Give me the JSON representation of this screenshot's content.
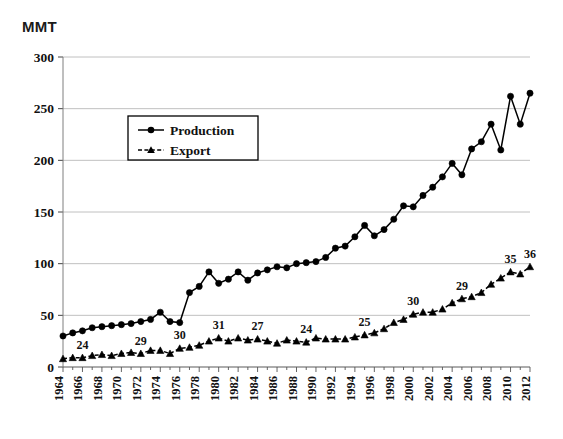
{
  "chart_data": {
    "type": "line",
    "title": "",
    "xlabel": "",
    "ylabel": "MMT",
    "ylim": [
      0,
      300
    ],
    "ytick_step": 50,
    "yticks": [
      0,
      50,
      100,
      150,
      200,
      250,
      300
    ],
    "grid": true,
    "legend_position": "upper-left-inside",
    "x": [
      1964,
      1965,
      1966,
      1967,
      1968,
      1969,
      1970,
      1971,
      1972,
      1973,
      1974,
      1975,
      1976,
      1977,
      1978,
      1979,
      1980,
      1981,
      1982,
      1983,
      1984,
      1985,
      1986,
      1987,
      1988,
      1989,
      1990,
      1991,
      1992,
      1993,
      1994,
      1995,
      1996,
      1997,
      1998,
      1999,
      2000,
      2001,
      2002,
      2003,
      2004,
      2005,
      2006,
      2007,
      2008,
      2009,
      2010,
      2011,
      2012
    ],
    "xtick_labels": [
      "1964",
      "1966",
      "1968",
      "1970",
      "1972",
      "1974",
      "1976",
      "1978",
      "1980",
      "1982",
      "1984",
      "1986",
      "1988",
      "1990",
      "1992",
      "1994",
      "1996",
      "1998",
      "2000",
      "2002",
      "2004",
      "2006",
      "2008",
      "2010",
      "2012"
    ],
    "xtick_values": [
      1964,
      1966,
      1968,
      1970,
      1972,
      1974,
      1976,
      1978,
      1980,
      1982,
      1984,
      1986,
      1988,
      1990,
      1992,
      1994,
      1996,
      1998,
      2000,
      2002,
      2004,
      2006,
      2008,
      2010,
      2012
    ],
    "series": [
      {
        "name": "Production",
        "marker": "circle",
        "line_style": "solid",
        "color": "#000000",
        "values": [
          30,
          33,
          35,
          38,
          39,
          40,
          41,
          42,
          44,
          46,
          53,
          44,
          43,
          72,
          78,
          92,
          81,
          85,
          92,
          84,
          91,
          94,
          97,
          96,
          100,
          101,
          102,
          106,
          115,
          117,
          126,
          137,
          127,
          133,
          143,
          156,
          155,
          166,
          174,
          184,
          197,
          186,
          211,
          218,
          235,
          210,
          262,
          235,
          265
        ]
      },
      {
        "name": "Export",
        "marker": "triangle",
        "line_style": "dashed",
        "color": "#000000",
        "values": [
          8,
          9,
          9,
          11,
          12,
          11,
          13,
          14,
          13,
          16,
          16,
          13,
          18,
          19,
          21,
          25,
          28,
          25,
          28,
          26,
          27,
          25,
          23,
          26,
          25,
          24,
          28,
          27,
          27,
          27,
          29,
          31,
          33,
          37,
          43,
          46,
          51,
          53,
          53,
          56,
          62,
          66,
          68,
          72,
          80,
          86,
          92,
          90,
          97
        ]
      }
    ],
    "annotations": [
      {
        "label": "24",
        "x": 1966,
        "series": "Export",
        "value": 9
      },
      {
        "label": "29",
        "x": 1972,
        "series": "Export",
        "value": 13
      },
      {
        "label": "30",
        "x": 1976,
        "series": "Export",
        "value": 18
      },
      {
        "label": "31",
        "x": 1980,
        "series": "Export",
        "value": 28
      },
      {
        "label": "27",
        "x": 1984,
        "series": "Export",
        "value": 27
      },
      {
        "label": "24",
        "x": 1989,
        "series": "Export",
        "value": 24
      },
      {
        "label": "25",
        "x": 1995,
        "series": "Export",
        "value": 31
      },
      {
        "label": "30",
        "x": 2000,
        "series": "Export",
        "value": 51
      },
      {
        "label": "29",
        "x": 2005,
        "series": "Export",
        "value": 66
      },
      {
        "label": "35",
        "x": 2010,
        "series": "Export",
        "value": 92
      },
      {
        "label": "36",
        "x": 2012,
        "series": "Export",
        "value": 97
      }
    ]
  },
  "axis": {
    "unit_label": "MMT"
  },
  "legend": {
    "items": [
      {
        "label": "Production"
      },
      {
        "label": "Export"
      }
    ]
  }
}
